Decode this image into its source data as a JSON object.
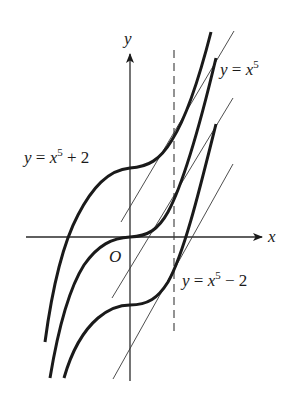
{
  "figure": {
    "axes": {
      "x_label": "x",
      "y_label": "y",
      "origin_label": "O"
    },
    "curves": [
      {
        "id": "upper",
        "label_base": "y = x",
        "label_exp": "5",
        "label_tail": " + 2",
        "offset": 2
      },
      {
        "id": "middle",
        "label_base": "y = x",
        "label_exp": "5",
        "label_tail": "",
        "offset": 0
      },
      {
        "id": "lower",
        "label_base": "y = x",
        "label_exp": "5",
        "label_tail": " − 2",
        "offset": -2
      }
    ],
    "dashed_line": {
      "orientation": "vertical",
      "style": "dashed"
    },
    "tangent_lines": {
      "count": 3,
      "relation": "parallel"
    },
    "colors": {
      "curve": "#1a1a1a",
      "axis": "#2a2a2a",
      "thin_line": "#3a3a3a",
      "background": "#ffffff"
    }
  }
}
